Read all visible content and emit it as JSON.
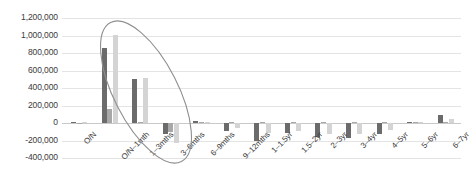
{
  "chart_data": {
    "type": "bar",
    "title": "",
    "subtitle": "",
    "xlabel": "",
    "ylabel": "",
    "grid": true,
    "legend_position": "none",
    "ylim": [
      -400000,
      1200000
    ],
    "ytick_step": 200000,
    "ytick_labels": [
      "1,200,000",
      "1,000,000",
      "800,000",
      "600,000",
      "400,000",
      "200,000",
      "0",
      "-200,000",
      "-400,000"
    ],
    "ytick_values": [
      1200000,
      1000000,
      800000,
      600000,
      400000,
      200000,
      0,
      -200000,
      -400000
    ],
    "categories": [
      "O/N",
      "O/N–1mth",
      "1–3mths",
      "3–6mths",
      "6–9mths",
      "9–12mths",
      "1–1.5yr",
      "1.5–2yr",
      "2–3yr",
      "3–4yr",
      "4–5yr",
      "5–6yr",
      "6–7yr"
    ],
    "series": [
      {
        "name": "Series 1",
        "color": "#6b6b6b",
        "values": [
          10000,
          860000,
          500000,
          -120000,
          20000,
          -90000,
          -200000,
          -110000,
          -160000,
          -170000,
          -130000,
          10000,
          95000
        ]
      },
      {
        "name": "Series 2",
        "color": "#a8a8a8",
        "values": [
          0,
          160000,
          15000,
          -100000,
          10000,
          10000,
          10000,
          10000,
          10000,
          10000,
          10000,
          10000,
          10000
        ]
      },
      {
        "name": "Series 3",
        "color": "#d4d4d4",
        "values": [
          8000,
          1010000,
          510000,
          -230000,
          8000,
          -55000,
          -110000,
          -90000,
          -120000,
          -120000,
          -85000,
          8000,
          45000
        ]
      }
    ],
    "annotations": [
      {
        "name": "highlight-ellipse",
        "shape": "ellipse",
        "color": "#8f8f8f",
        "covers": [
          "O/N",
          "O/N–1mth",
          "1–3mths",
          "3–6mths"
        ]
      }
    ]
  }
}
